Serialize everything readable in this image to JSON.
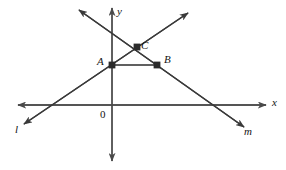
{
  "figure": {
    "background_color": "#ffffff",
    "stroke_color": "#3a3a3a",
    "axis_color": "#4a4a4a",
    "point_color": "#2b2b2b",
    "label_color": "#141414",
    "width": 286,
    "height": 170
  },
  "axes": {
    "x_label": "x",
    "y_label": "y",
    "origin_label": "0",
    "x_axis": {
      "x1": 18,
      "y1": 105,
      "x2": 266,
      "y2": 105
    },
    "y_axis": {
      "x1": 112,
      "y1": 8,
      "x2": 112,
      "y2": 161
    },
    "x_label_pos": {
      "x": 272,
      "y": 98
    },
    "y_label_pos": {
      "x": 117,
      "y": 7
    },
    "origin_label_pos": {
      "x": 101,
      "y": 109
    }
  },
  "lines": [
    {
      "name": "l",
      "label": "l",
      "label_pos": {
        "x": 16,
        "y": 124
      },
      "x1": 24,
      "y1": 124,
      "x2": 188,
      "y2": 13,
      "description": "line l rises from lower-left to upper-right"
    },
    {
      "name": "m",
      "label": "m",
      "label_pos": {
        "x": 245,
        "y": 127
      },
      "x1": 79,
      "y1": 10,
      "x2": 244,
      "y2": 127,
      "description": "line m falls from upper-left to lower-right"
    }
  ],
  "segment": {
    "name": "AB",
    "x1": 112,
    "y1": 65,
    "x2": 157,
    "y2": 65,
    "description": "horizontal segment from A to B"
  },
  "points": [
    {
      "label": "A",
      "x": 112,
      "y": 65,
      "label_x": 98,
      "label_y": 57
    },
    {
      "label": "C",
      "x": 137,
      "y": 47,
      "label_x": 142,
      "label_y": 41
    },
    {
      "label": "B",
      "x": 157,
      "y": 65,
      "label_x": 165,
      "label_y": 55
    }
  ]
}
